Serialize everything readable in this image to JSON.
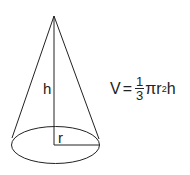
{
  "figure": {
    "type": "cone-volume-diagram",
    "labels": {
      "height": "h",
      "radius": "r"
    },
    "formula": {
      "lhs": "V",
      "equals": "=",
      "fraction": {
        "numerator": "1",
        "denominator": "3"
      },
      "pi": "π",
      "r": "r",
      "exponent": "2",
      "h": "h"
    }
  }
}
